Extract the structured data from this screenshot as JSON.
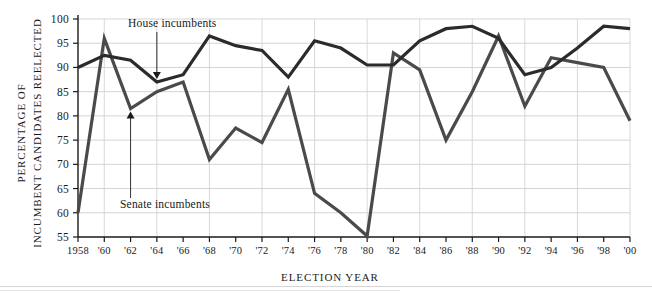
{
  "chart_data": {
    "type": "line",
    "title": "",
    "xlabel": "ELECTION YEAR",
    "ylabel": "PERCENTAGE OF INCUMBENT CANDIDATES REELECTED",
    "ylabel_line1": "PERCENTAGE OF",
    "ylabel_line2": "INCUMBENT CANDIDATES REELECTED",
    "grid": true,
    "legend_position": "inline-annotations",
    "xlim": [
      1958,
      2000
    ],
    "ylim": [
      55,
      100
    ],
    "yticks": [
      55,
      60,
      65,
      70,
      75,
      80,
      85,
      90,
      95,
      100
    ],
    "ytick_labels": [
      "55",
      "60",
      "65",
      "70",
      "75",
      "80",
      "85",
      "90",
      "95",
      "100"
    ],
    "x": [
      1958,
      1960,
      1962,
      1964,
      1966,
      1968,
      1970,
      1972,
      1974,
      1976,
      1978,
      1980,
      1982,
      1984,
      1986,
      1988,
      1990,
      1992,
      1994,
      1996,
      1998,
      2000
    ],
    "categories": [
      "1958",
      "'60",
      "'62",
      "'64",
      "'66",
      "'68",
      "'70",
      "'72",
      "'74",
      "'76",
      "'78",
      "'80",
      "'82",
      "'84",
      "'86",
      "'88",
      "'90",
      "'92",
      "'94",
      "'96",
      "'98",
      "'00"
    ],
    "series": [
      {
        "name": "House incumbents",
        "color": "#2b2b2b",
        "width": 3.2,
        "values": [
          90.0,
          92.5,
          91.5,
          87.0,
          88.5,
          96.5,
          94.5,
          93.5,
          88.0,
          95.5,
          94.0,
          90.5,
          90.5,
          95.5,
          98.0,
          98.5,
          96.0,
          88.5,
          90.0,
          94.0,
          98.5,
          98.0
        ]
      },
      {
        "name": "Senate incumbents",
        "color": "#4a4a4a",
        "width": 3.2,
        "values": [
          60.0,
          96.0,
          81.5,
          85.0,
          87.0,
          71.0,
          77.5,
          74.5,
          85.5,
          64.0,
          60.0,
          55.2,
          93.0,
          89.5,
          75.0,
          85.0,
          96.5,
          82.0,
          92.0,
          91.0,
          90.0,
          79.0
        ]
      }
    ],
    "annotations": [
      {
        "name": "house-incumbents-label",
        "text": "House incumbents",
        "target_year": 1964,
        "target_value": 87.0
      },
      {
        "name": "senate-incumbents-label",
        "text": "Senate incumbents",
        "target_year": 1962,
        "target_value": 81.5
      }
    ]
  }
}
